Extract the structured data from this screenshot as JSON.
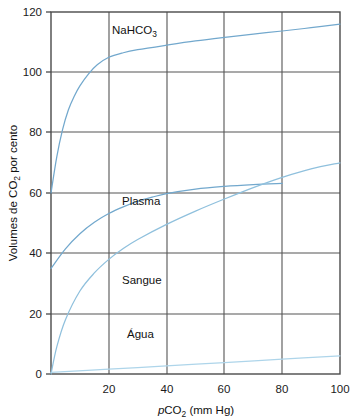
{
  "chart_data": {
    "type": "line",
    "title": "",
    "xlabel": "pCO2  (mm Hg)",
    "xlabel_parts": {
      "italic_prefix": "p",
      "main": "CO",
      "subscript": "2",
      "suffix": "(mm Hg)"
    },
    "ylabel": "Volumes de CO2 por cento",
    "ylabel_parts": {
      "before": "Volumes de CO",
      "subscript": "2",
      "after": " por cento"
    },
    "xlim": [
      0,
      100
    ],
    "ylim": [
      0,
      120
    ],
    "xticks": [
      20,
      40,
      60,
      80,
      100
    ],
    "yticks": [
      0,
      20,
      40,
      60,
      80,
      100,
      120
    ],
    "xtick_labels": [
      "20",
      "40",
      "60",
      "80",
      "100"
    ],
    "ytick_labels": [
      "0",
      "20",
      "40",
      "60",
      "80",
      "100",
      "120"
    ],
    "grid": true,
    "legend_position": "inline-annotations",
    "series": [
      {
        "name": "NaHCO3",
        "label_parts": {
          "main": "NaHCO",
          "subscript": "3"
        },
        "color": "#72a8cd",
        "x": [
          0,
          2,
          4,
          6,
          8,
          10,
          13,
          16,
          20,
          25,
          30,
          40,
          50,
          60,
          70,
          80,
          90,
          100
        ],
        "values": [
          60,
          72,
          81,
          87.5,
          92,
          95.5,
          99.5,
          102.5,
          105,
          106.5,
          107.5,
          109,
          110.4,
          111.6,
          112.7,
          113.7,
          114.8,
          116
        ]
      },
      {
        "name": "Plasma",
        "label_parts": {
          "main": "Plasma",
          "subscript": ""
        },
        "color": "#72a8cd",
        "x": [
          0,
          5,
          10,
          15,
          20,
          25,
          30,
          35,
          40,
          50,
          60,
          70,
          80
        ],
        "values": [
          35,
          41.5,
          46.5,
          50.3,
          53.2,
          55.4,
          57.2,
          58.6,
          59.8,
          61.3,
          62.2,
          62.8,
          63.2
        ]
      },
      {
        "name": "Sangue",
        "label_parts": {
          "main": "Sangue",
          "subscript": ""
        },
        "color": "#8fc0dd",
        "x": [
          0,
          2,
          5,
          10,
          15,
          20,
          25,
          30,
          40,
          50,
          60,
          70,
          80,
          90,
          100
        ],
        "values": [
          0,
          9,
          18,
          27.5,
          33.5,
          38,
          41.6,
          44.6,
          49.6,
          54,
          58,
          61.8,
          65.2,
          68,
          70
        ]
      },
      {
        "name": "Agua",
        "label_parts": {
          "main": "Água",
          "subscript": ""
        },
        "color": "#aed5ea",
        "x": [
          0,
          20,
          40,
          60,
          80,
          100
        ],
        "values": [
          0.5,
          1.6,
          2.7,
          3.8,
          4.9,
          6.0
        ]
      }
    ],
    "annotations": [
      {
        "text": "NaHCO3",
        "x": 20,
        "y": 113
      },
      {
        "text": "Plasma",
        "x": 17,
        "y": 54
      },
      {
        "text": "Sangue",
        "x": 17,
        "y": 31
      },
      {
        "text": "Água",
        "x": 18,
        "y": 13
      }
    ]
  },
  "colors": {
    "frame": "#4a4a4a",
    "grid": "#555555",
    "curve_primary": "#72a8cd",
    "curve_light": "#aed5ea",
    "background": "#ffffff",
    "text": "#111111"
  }
}
